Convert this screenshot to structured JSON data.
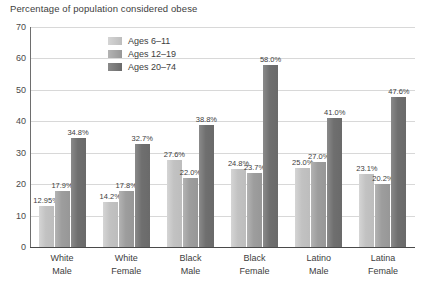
{
  "chart_data": {
    "type": "bar",
    "title": "Percentage of population considered obese",
    "xlabel": "",
    "ylabel": "",
    "ylim": [
      0,
      70
    ],
    "yticks": [
      0,
      10,
      20,
      30,
      40,
      50,
      60,
      70
    ],
    "grid": true,
    "legend_position": "inside-top-left",
    "categories": [
      "White Male",
      "White Female",
      "Black Male",
      "Black Female",
      "Latino Male",
      "Latina Female"
    ],
    "category_lines": [
      [
        "White",
        "Male"
      ],
      [
        "White",
        "Female"
      ],
      [
        "Black",
        "Male"
      ],
      [
        "Black",
        "Female"
      ],
      [
        "Latino",
        "Male"
      ],
      [
        "Latina",
        "Female"
      ]
    ],
    "series": [
      {
        "name": "Ages 6–11",
        "color": "#c2c2c2",
        "values": [
          12.95,
          14.2,
          27.6,
          24.8,
          25.0,
          23.1
        ],
        "labels": [
          "12.95%",
          "14.2%",
          "27.6%",
          "24.8%",
          "25.0%",
          "23.1%"
        ]
      },
      {
        "name": "Ages 12–19",
        "color": "#9d9d9d",
        "values": [
          17.9,
          17.8,
          22.0,
          23.7,
          27.0,
          20.2
        ],
        "labels": [
          "17.9%",
          "17.8%",
          "22.0%",
          "23.7%",
          "27.0%",
          "20.2%"
        ]
      },
      {
        "name": "Ages 20–74",
        "color": "#6f6f6f",
        "values": [
          34.8,
          32.7,
          38.8,
          58.0,
          41.0,
          47.6
        ],
        "labels": [
          "34.8%",
          "32.7%",
          "38.8%",
          "58.0%",
          "41.0%",
          "47.6%"
        ]
      }
    ]
  }
}
